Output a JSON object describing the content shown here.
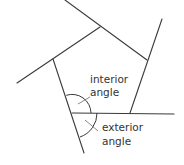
{
  "diagram": {
    "shape": "pentagon",
    "vertices": [
      {
        "name": "top",
        "x": 100,
        "y": 27
      },
      {
        "name": "right",
        "x": 147,
        "y": 60
      },
      {
        "name": "bottom-right",
        "x": 130,
        "y": 113
      },
      {
        "name": "bottom-left",
        "x": 72,
        "y": 113
      },
      {
        "name": "left",
        "x": 53,
        "y": 59
      }
    ],
    "extended_sides": [
      {
        "from": [
          65,
          0
        ],
        "to": [
          147,
          60
        ]
      },
      {
        "from": [
          162,
          19
        ],
        "to": [
          130,
          113
        ]
      },
      {
        "from": [
          72,
          113
        ],
        "to": [
          174,
          114
        ]
      },
      {
        "from": [
          53,
          59
        ],
        "to": [
          84,
          153
        ]
      },
      {
        "from": [
          100,
          27
        ],
        "to": [
          17,
          83
        ]
      }
    ],
    "labels": {
      "interior_line1": "interior",
      "interior_line2": "angle",
      "exterior_line1": "exterior",
      "exterior_line2": "angle"
    },
    "colors": {
      "line": "#3a3a3a",
      "text": "#333333",
      "background": "#ffffff"
    }
  }
}
